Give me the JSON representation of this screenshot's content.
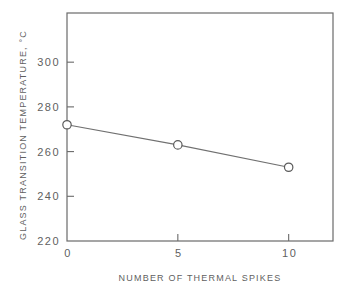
{
  "chart_data": {
    "type": "line",
    "title": "",
    "xlabel": "NUMBER OF THERMAL SPIKES",
    "ylabel": "GLASS TRANSITION TEMPERATURE, °C",
    "xlim": [
      0,
      12
    ],
    "ylim": [
      220,
      322
    ],
    "grid": false,
    "legend": null,
    "x_ticks": [
      0,
      5,
      10
    ],
    "x_tick_labels": [
      "0",
      "5",
      "10"
    ],
    "y_ticks": [
      220,
      240,
      260,
      280,
      300
    ],
    "y_tick_labels": [
      "220",
      "240",
      "260",
      "280",
      "300"
    ],
    "series": [
      {
        "name": "Tg",
        "marker": "open-circle",
        "x": [
          0,
          5,
          10
        ],
        "values": [
          272,
          263,
          253
        ]
      }
    ]
  }
}
